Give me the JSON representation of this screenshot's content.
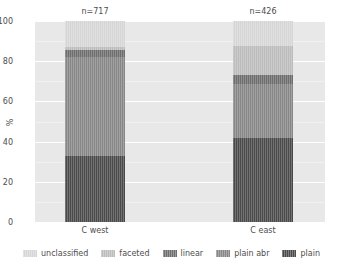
{
  "chart_data": {
    "type": "bar",
    "subtype": "stacked-percentage",
    "title": "",
    "xlabel": "",
    "ylabel": "%",
    "ylim": [
      0,
      100
    ],
    "yticks": [
      0,
      20,
      40,
      60,
      80,
      100
    ],
    "ytick_labels": [
      "0",
      "20",
      "40",
      "60",
      "80",
      "100"
    ],
    "grid": true,
    "grid_axis": "y",
    "legend_position": "bottom",
    "categories": [
      "C west",
      "C east"
    ],
    "group_annotations": [
      "n=717",
      "n=426"
    ],
    "sample_sizes": [
      717,
      426
    ],
    "series": [
      {
        "name": "plain",
        "values": [
          33.0,
          42.0
        ],
        "color": "#4a4a4a"
      },
      {
        "name": "plain abr",
        "values": [
          49.0,
          26.5
        ],
        "color": "#878787"
      },
      {
        "name": "linear",
        "values": [
          3.5,
          4.5
        ],
        "color": "#6e6e6e"
      },
      {
        "name": "faceted",
        "values": [
          1.5,
          14.5
        ],
        "color": "#bcbcbc"
      },
      {
        "name": "unclassified",
        "values": [
          13.0,
          12.5
        ],
        "color": "#d6d6d6"
      }
    ],
    "stack_order_bottom_to_top": [
      "plain",
      "plain abr",
      "linear",
      "faceted",
      "unclassified"
    ],
    "cumulative_tops": {
      "C west": {
        "plain": 33.0,
        "plain abr": 82.0,
        "linear": 85.5,
        "faceted": 87.0,
        "unclassified": 100.0
      },
      "C east": {
        "plain": 42.0,
        "plain abr": 68.5,
        "linear": 73.0,
        "faceted": 87.5,
        "unclassified": 100.0
      }
    },
    "plot_background": "#e8e8e8",
    "gridline_color": "#ffffff"
  },
  "axis": {
    "y_label": "%",
    "y_ticks": [
      "0",
      "20",
      "40",
      "60",
      "80",
      "100"
    ],
    "x_ticks": [
      "C west",
      "C east"
    ]
  },
  "annotations": {
    "west_n": "n=717",
    "east_n": "n=426"
  },
  "legend": {
    "items": [
      {
        "label": "unclassified",
        "color": "#d6d6d6"
      },
      {
        "label": "faceted",
        "color": "#bcbcbc"
      },
      {
        "label": "linear",
        "color": "#6e6e6e"
      },
      {
        "label": "plain abr",
        "color": "#878787"
      },
      {
        "label": "plain",
        "color": "#4a4a4a"
      }
    ]
  }
}
